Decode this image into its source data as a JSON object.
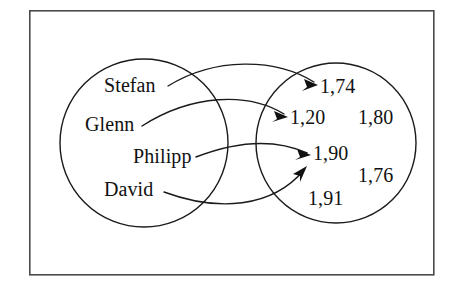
{
  "figure": {
    "type": "mapping-diagram",
    "title": "",
    "background_color": "#ffffff",
    "stroke_color": "#1a1a1a",
    "frame_color": "#4a4a4a"
  },
  "frame": {
    "x": 29,
    "y": 10,
    "width": 405,
    "height": 265
  },
  "domain_set": {
    "name": "left-circle",
    "cx": 144,
    "cy": 143,
    "r": 84,
    "items": [
      {
        "id": "stefan",
        "label": "Stefan",
        "x": 104,
        "y": 92
      },
      {
        "id": "glenn",
        "label": "Glenn",
        "x": 85,
        "y": 131
      },
      {
        "id": "philipp",
        "label": "Philipp",
        "x": 133,
        "y": 163
      },
      {
        "id": "david",
        "label": "David",
        "x": 104,
        "y": 196
      }
    ]
  },
  "codomain_set": {
    "name": "right-circle",
    "cx": 336,
    "cy": 143,
    "r": 80,
    "items": [
      {
        "id": "v174",
        "label": "1,74",
        "x": 320,
        "y": 93
      },
      {
        "id": "v120",
        "label": "1,20",
        "x": 290,
        "y": 124
      },
      {
        "id": "v180",
        "label": "1,80",
        "x": 358,
        "y": 124
      },
      {
        "id": "v190",
        "label": "1,90",
        "x": 313,
        "y": 160
      },
      {
        "id": "v176",
        "label": "1,76",
        "x": 358,
        "y": 182
      },
      {
        "id": "v191",
        "label": "1,91",
        "x": 308,
        "y": 205
      }
    ]
  },
  "mappings": [
    {
      "id": "stefan-to-174",
      "from": "stefan",
      "to": "v174",
      "label": ""
    },
    {
      "id": "glenn-to-120",
      "from": "glenn",
      "to": "v120",
      "label": ""
    },
    {
      "id": "philipp-to-190",
      "from": "philipp",
      "to": "v190",
      "label": ""
    },
    {
      "id": "david-to-190",
      "from": "david",
      "to": "v190",
      "label": ""
    }
  ],
  "unmapped_values": [
    "1,80",
    "1,76",
    "1,91"
  ]
}
